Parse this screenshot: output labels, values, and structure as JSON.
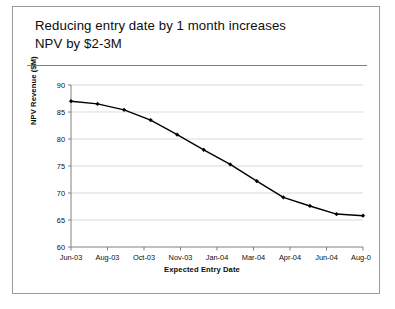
{
  "slide": {
    "title": "Reducing entry date by 1 month increases\nNPV by $2-3M"
  },
  "chart_data": {
    "type": "line",
    "title": "",
    "xlabel": "Expected Entry Date",
    "ylabel": "NPV Revenue ($M)",
    "ylim": [
      60,
      90
    ],
    "ytick_labels": [
      "60",
      "65",
      "70",
      "75",
      "80",
      "85",
      "90"
    ],
    "yticks": [
      60,
      65,
      70,
      75,
      80,
      85,
      90
    ],
    "xtick_labels": [
      "Jun-03",
      "Aug-03",
      "Oct-03",
      "Nov-03",
      "Jan-04",
      "Mar-04",
      "Apr-04",
      "Jun-04",
      "Aug-04"
    ],
    "grid": "horizontal",
    "legend": "none",
    "marker": "diamond",
    "line_color": "#000000",
    "grid_color": "#d9d9d9",
    "axis_color": "#808080",
    "x_index": [
      0,
      1,
      2,
      3,
      4,
      5,
      6,
      7,
      8,
      9,
      10,
      11
    ],
    "values": [
      87.0,
      86.5,
      85.4,
      83.5,
      80.8,
      78.0,
      75.3,
      72.2,
      69.2,
      67.6,
      66.1,
      65.8
    ]
  }
}
